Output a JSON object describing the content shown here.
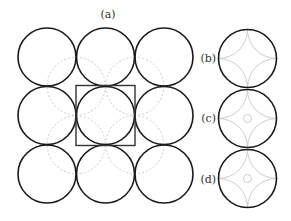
{
  "figure": {
    "panel_a": {
      "label": "(a)",
      "grid_rows": 3,
      "grid_cols": 3,
      "unit_cell_row": 1,
      "unit_cell_col": 1
    },
    "panels_right": [
      {
        "label": "(b)",
        "center_circle": false
      },
      {
        "label": "(c)",
        "center_circle": true
      },
      {
        "label": "(d)",
        "center_circle": true
      }
    ],
    "colors": {
      "circle_stroke": "#1a1a1a",
      "ghost_stroke": "#cccccc",
      "unit_cell_stroke": "#333333"
    }
  }
}
